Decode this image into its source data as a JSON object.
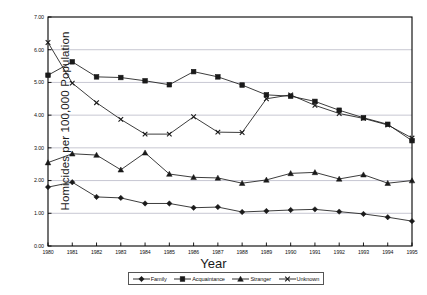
{
  "chart_data": {
    "type": "line",
    "title": "",
    "xlabel": "Year",
    "ylabel": "Homicides per 100,000 Population",
    "x": [
      1980,
      1981,
      1982,
      1983,
      1984,
      1985,
      1986,
      1987,
      1988,
      1989,
      1990,
      1991,
      1992,
      1993,
      1994,
      1995
    ],
    "xtick_labels": [
      "1980",
      "1981",
      "1982",
      "1983",
      "1984",
      "1985",
      "1986",
      "1987",
      "1988",
      "1989",
      "1990",
      "1991",
      "1992",
      "1993",
      "1994",
      "1995"
    ],
    "ytick_labels": [
      "0.00",
      "1.00",
      "2.00",
      "3.00",
      "4.00",
      "5.00",
      "6.00",
      "7.00"
    ],
    "ylim": [
      0.0,
      7.0
    ],
    "ytick_step": 1.0,
    "grid": "horizontal",
    "legend_position": "bottom",
    "series": [
      {
        "name": "Family",
        "marker": "diamond",
        "values": [
          1.8,
          1.95,
          1.5,
          1.47,
          1.3,
          1.3,
          1.17,
          1.19,
          1.04,
          1.07,
          1.1,
          1.12,
          1.05,
          0.98,
          0.88,
          0.76
        ]
      },
      {
        "name": "Acquaintance",
        "marker": "square",
        "values": [
          5.22,
          5.63,
          5.17,
          5.15,
          5.05,
          4.93,
          5.33,
          5.17,
          4.92,
          4.62,
          4.58,
          4.42,
          4.15,
          3.92,
          3.72,
          3.22
        ]
      },
      {
        "name": "Stranger",
        "marker": "triangle",
        "values": [
          2.55,
          2.82,
          2.78,
          2.33,
          2.85,
          2.2,
          2.1,
          2.08,
          1.92,
          2.02,
          2.22,
          2.25,
          2.05,
          2.18,
          1.92,
          2.0
        ]
      },
      {
        "name": "Unknown",
        "marker": "cross",
        "values": [
          6.22,
          4.98,
          4.38,
          3.87,
          3.42,
          3.42,
          3.95,
          3.48,
          3.47,
          4.5,
          4.62,
          4.3,
          4.05,
          3.9,
          3.7,
          3.3
        ]
      }
    ]
  },
  "legend": {
    "items": [
      {
        "label": "Family",
        "marker": "diamond"
      },
      {
        "label": "Acquaintance",
        "marker": "square"
      },
      {
        "label": "Stranger",
        "marker": "triangle"
      },
      {
        "label": "Unknown",
        "marker": "cross"
      }
    ]
  },
  "colors": {
    "line": "#1a1a1a",
    "grid": "#b9b9c6",
    "axis": "#000000",
    "background": "#ffffff"
  }
}
